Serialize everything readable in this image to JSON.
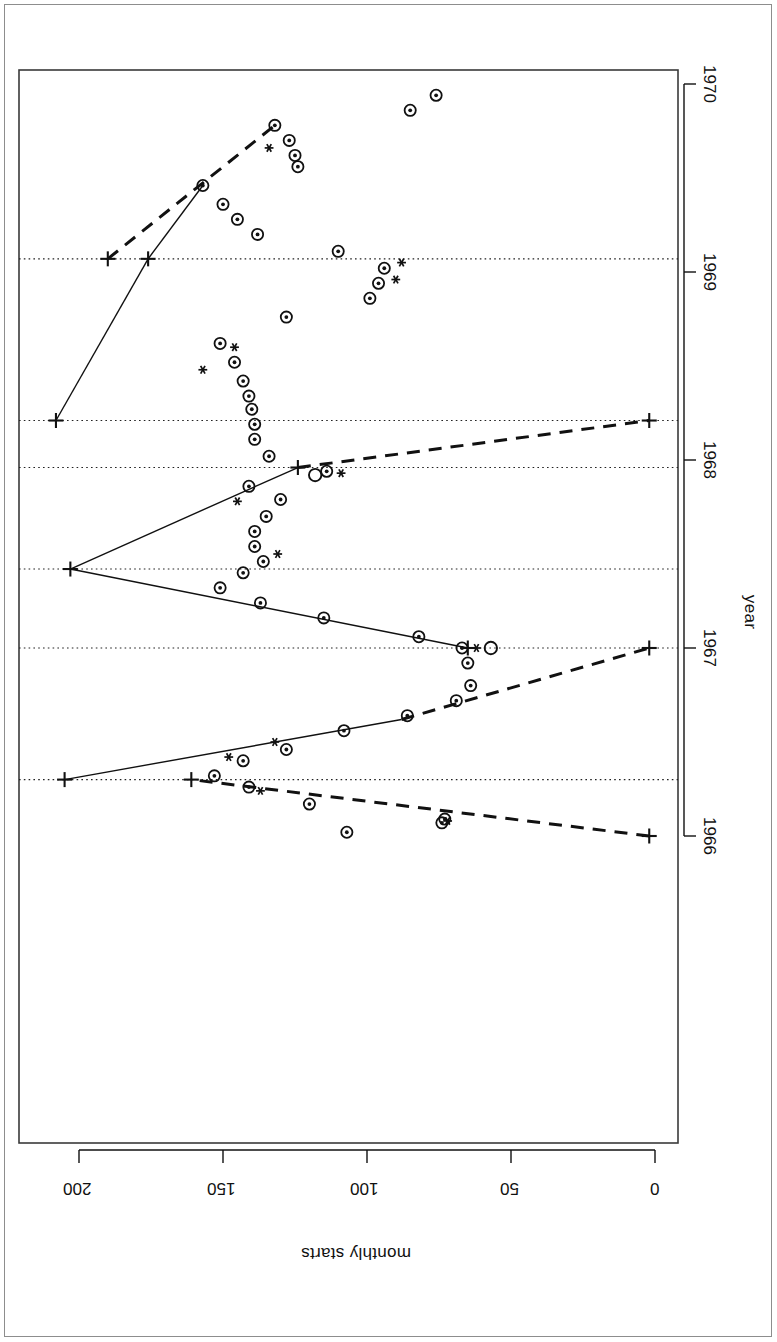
{
  "figure": {
    "orientation": "rotated-90",
    "background": "#ffffff",
    "frame_color": "#3a3a3a",
    "ink_color": "#111111"
  },
  "chart_data": {
    "type": "scatter",
    "title": "",
    "subtitle": "",
    "xlabel": "year",
    "ylabel": "monthly starts",
    "xlim": [
      1965.75,
      1970.15
    ],
    "ylim": [
      0,
      215
    ],
    "xticks": [
      1966,
      1967,
      1968,
      1969,
      1970
    ],
    "xticklabels": [
      "1966",
      "1967",
      "1968",
      "1969",
      "1970"
    ],
    "yticks": [
      0,
      50,
      100,
      150,
      200
    ],
    "yticklabels": [
      "0",
      "50",
      "100",
      "150",
      "200"
    ],
    "grid": false,
    "legend": false,
    "legend_position": "none",
    "annotations": [
      "dotted vertical reference lines mark regime-change breakpoints",
      "solid and dashed segments are fitted trend lines",
      "plus markers are segment endpoints / predicted values",
      "asterisk markers flag selected observations"
    ],
    "breakpoints": [
      1966.3,
      1967.0,
      1967.42,
      1967.96,
      1968.21,
      1969.07
    ],
    "series": [
      {
        "name": "observations",
        "marker": "circle",
        "points": [
          {
            "x": 1966.02,
            "y": 107
          },
          {
            "x": 1966.07,
            "y": 74
          },
          {
            "x": 1966.09,
            "y": 73
          },
          {
            "x": 1966.17,
            "y": 120
          },
          {
            "x": 1966.26,
            "y": 141
          },
          {
            "x": 1966.32,
            "y": 153
          },
          {
            "x": 1966.4,
            "y": 143
          },
          {
            "x": 1966.46,
            "y": 128
          },
          {
            "x": 1966.56,
            "y": 108
          },
          {
            "x": 1966.64,
            "y": 86
          },
          {
            "x": 1966.72,
            "y": 69
          },
          {
            "x": 1966.8,
            "y": 64
          },
          {
            "x": 1966.92,
            "y": 65
          },
          {
            "x": 1967.0,
            "y": 67
          },
          {
            "x": 1967.06,
            "y": 82
          },
          {
            "x": 1967.16,
            "y": 115
          },
          {
            "x": 1967.24,
            "y": 137
          },
          {
            "x": 1967.32,
            "y": 151
          },
          {
            "x": 1967.4,
            "y": 143
          },
          {
            "x": 1967.46,
            "y": 136
          },
          {
            "x": 1967.54,
            "y": 139
          },
          {
            "x": 1967.62,
            "y": 139
          },
          {
            "x": 1967.7,
            "y": 135
          },
          {
            "x": 1967.79,
            "y": 130
          },
          {
            "x": 1967.86,
            "y": 141
          },
          {
            "x": 1967.94,
            "y": 114
          },
          {
            "x": 1968.02,
            "y": 134
          },
          {
            "x": 1968.11,
            "y": 139
          },
          {
            "x": 1968.19,
            "y": 139
          },
          {
            "x": 1968.27,
            "y": 140
          },
          {
            "x": 1968.34,
            "y": 141
          },
          {
            "x": 1968.42,
            "y": 143
          },
          {
            "x": 1968.52,
            "y": 146
          },
          {
            "x": 1968.62,
            "y": 151
          },
          {
            "x": 1968.76,
            "y": 128
          },
          {
            "x": 1968.86,
            "y": 99
          },
          {
            "x": 1968.94,
            "y": 96
          },
          {
            "x": 1969.02,
            "y": 94
          },
          {
            "x": 1969.11,
            "y": 110
          },
          {
            "x": 1969.2,
            "y": 138
          },
          {
            "x": 1969.28,
            "y": 145
          },
          {
            "x": 1969.36,
            "y": 150
          },
          {
            "x": 1969.46,
            "y": 157
          },
          {
            "x": 1969.56,
            "y": 124
          },
          {
            "x": 1969.62,
            "y": 125
          },
          {
            "x": 1969.7,
            "y": 127
          },
          {
            "x": 1969.78,
            "y": 132
          },
          {
            "x": 1969.86,
            "y": 85
          },
          {
            "x": 1969.94,
            "y": 76
          }
        ]
      },
      {
        "name": "flagged",
        "marker": "asterisk",
        "points": [
          {
            "x": 1966.08,
            "y": 72
          },
          {
            "x": 1966.24,
            "y": 137
          },
          {
            "x": 1966.42,
            "y": 148
          },
          {
            "x": 1966.5,
            "y": 132
          },
          {
            "x": 1967.0,
            "y": 62
          },
          {
            "x": 1967.5,
            "y": 131
          },
          {
            "x": 1967.78,
            "y": 145
          },
          {
            "x": 1967.93,
            "y": 109
          },
          {
            "x": 1968.48,
            "y": 157
          },
          {
            "x": 1968.6,
            "y": 146
          },
          {
            "x": 1968.96,
            "y": 90
          },
          {
            "x": 1969.05,
            "y": 88
          },
          {
            "x": 1969.66,
            "y": 134
          }
        ]
      },
      {
        "name": "open-circle",
        "marker": "open-circle",
        "points": [
          {
            "x": 1967.0,
            "y": 57
          },
          {
            "x": 1967.92,
            "y": 118
          }
        ]
      },
      {
        "name": "endpoints",
        "marker": "plus",
        "points": [
          {
            "x": 1966.0,
            "y": 2
          },
          {
            "x": 1966.3,
            "y": 161
          },
          {
            "x": 1966.3,
            "y": 205
          },
          {
            "x": 1967.0,
            "y": 2
          },
          {
            "x": 1967.0,
            "y": 65
          },
          {
            "x": 1967.42,
            "y": 203
          },
          {
            "x": 1967.96,
            "y": 124
          },
          {
            "x": 1968.21,
            "y": 2
          },
          {
            "x": 1968.21,
            "y": 208
          },
          {
            "x": 1969.07,
            "y": 176
          },
          {
            "x": 1969.07,
            "y": 190
          }
        ]
      }
    ],
    "fitted_segments": [
      {
        "style": "dashed",
        "from": {
          "x": 1966.0,
          "y": 2
        },
        "to": {
          "x": 1966.3,
          "y": 161
        }
      },
      {
        "style": "solid",
        "from": {
          "x": 1966.3,
          "y": 205
        },
        "to": {
          "x": 1966.62,
          "y": 88
        }
      },
      {
        "style": "dashed",
        "from": {
          "x": 1966.62,
          "y": 88
        },
        "to": {
          "x": 1967.0,
          "y": 2
        }
      },
      {
        "style": "solid",
        "from": {
          "x": 1967.0,
          "y": 65
        },
        "to": {
          "x": 1967.42,
          "y": 203
        }
      },
      {
        "style": "solid",
        "from": {
          "x": 1967.42,
          "y": 203
        },
        "to": {
          "x": 1967.96,
          "y": 124
        }
      },
      {
        "style": "dashed",
        "from": {
          "x": 1967.96,
          "y": 124
        },
        "to": {
          "x": 1968.21,
          "y": 2
        }
      },
      {
        "style": "solid",
        "from": {
          "x": 1968.21,
          "y": 208
        },
        "to": {
          "x": 1969.07,
          "y": 176
        }
      },
      {
        "style": "solid",
        "from": {
          "x": 1969.07,
          "y": 176
        },
        "to": {
          "x": 1969.46,
          "y": 157
        }
      },
      {
        "style": "dashed",
        "from": {
          "x": 1969.07,
          "y": 190
        },
        "to": {
          "x": 1969.78,
          "y": 132
        }
      }
    ]
  }
}
